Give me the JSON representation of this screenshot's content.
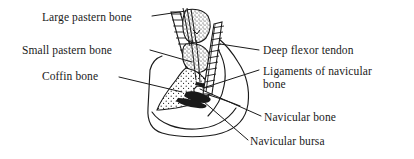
{
  "diagram": {
    "ink_color": "#1a1a1a",
    "background_color": "#ffffff",
    "labels": [
      {
        "id": "large-pastern-bone",
        "text": "Large pastern bone"
      },
      {
        "id": "small-pastern-bone",
        "text": "Small pastern bone"
      },
      {
        "id": "coffin-bone",
        "text": "Coffin bone"
      },
      {
        "id": "deep-flexor-tendon",
        "text": "Deep flexor tendon"
      },
      {
        "id": "ligaments-of-navicular-bone",
        "text_line1": "Ligaments of navicular",
        "text_line2": "bone"
      },
      {
        "id": "navicular-bone",
        "text": "Navicular bone"
      },
      {
        "id": "navicular-bursa",
        "text": "Navicular bursa"
      }
    ]
  }
}
